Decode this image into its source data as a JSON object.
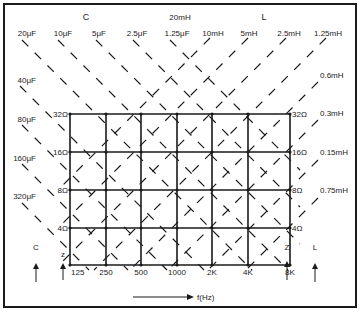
{
  "chart_data": {
    "type": "diagram",
    "x_axis": {
      "label": "f(Hz)",
      "ticks": [
        "125",
        "250",
        "500",
        "1000",
        "2K",
        "4K",
        "8K"
      ]
    },
    "y_axis": {
      "label_left": "z",
      "label_right": "Z",
      "ticks": [
        "4Ω",
        "8Ω",
        "16Ω",
        "32Ω"
      ]
    },
    "capacitance": {
      "header": "C",
      "arrow_label": "C",
      "top_labels": [
        "20μF",
        "10μF",
        "5μF",
        "2.5μF",
        "1.25μF"
      ],
      "side_labels": [
        "40μF",
        "80μF",
        "160μF",
        "320μF"
      ]
    },
    "inductance": {
      "header": "L",
      "center_label": "20mH",
      "arrow_label": "L",
      "top_labels": [
        "10mH",
        "5mH",
        "2.5mH",
        "1.25mH"
      ],
      "side_labels": [
        "0.6mH",
        "0.3mH",
        "0.15mH",
        "0.75mH"
      ]
    },
    "colors": {
      "ink": "#1a1a1a",
      "background": "#ffffff"
    }
  }
}
